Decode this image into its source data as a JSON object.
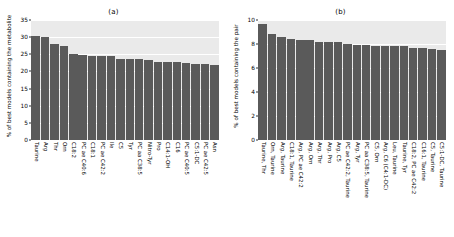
{
  "figure": {
    "panels": [
      {
        "title": "(a)",
        "ylabel": "% of best models containing the metabolite"
      },
      {
        "title": "(b)",
        "ylabel": "% of best models containing the pair"
      }
    ]
  },
  "chart_data": [
    {
      "type": "bar",
      "title": "(a)",
      "xlabel": "",
      "ylabel": "% of best models containing the metabolite",
      "ylim": [
        0,
        35
      ],
      "yticks": [
        0,
        5,
        10,
        15,
        20,
        25,
        30,
        35
      ],
      "grid": true,
      "legend": "none",
      "bar_color": "#5a5a5a",
      "categories": [
        "Taurine",
        "Arg",
        "Thr",
        "Orn",
        "C18:2",
        "PC ae C40:6",
        "C18:1",
        "PC ae C42:2",
        "Ile",
        "C5",
        "Tyr",
        "PC aa C38:5",
        "Nitro-Tyr",
        "Pro",
        "C14:1-OH",
        "C16",
        "PC ae C40:5",
        "C5:1-DC",
        "PC ae C42:5",
        "Asn"
      ],
      "values": [
        30.3,
        30.0,
        27.9,
        27.4,
        25.1,
        24.9,
        24.6,
        24.5,
        24.4,
        23.7,
        23.6,
        23.5,
        23.2,
        22.9,
        22.8,
        22.7,
        22.4,
        22.3,
        22.2,
        22.0
      ]
    },
    {
      "type": "bar",
      "title": "(b)",
      "xlabel": "",
      "ylabel": "% of best models containing the pair",
      "ylim": [
        0,
        10
      ],
      "yticks": [
        0,
        2,
        4,
        6,
        8,
        10
      ],
      "grid": true,
      "legend": "none",
      "bar_color": "#5a5a5a",
      "categories": [
        "Taurine, Thr",
        "Orn, Taurine",
        "Arg, Taurine",
        "C18:1, Taurine",
        "Arg, PC ae C42:2",
        "Arg, Orn",
        "Arg, Thr",
        "Arg, Pro",
        "Arg, C5",
        "PC ae C42:2, Taurine",
        "Arg, Tyr",
        "PC aa C38:5, Taurine",
        "C5, Orn",
        "Arg, C6 (C4:1-DC)",
        "Leu, Taurine",
        "Taurine, Tyr",
        "C18:2, PC ae C42:2",
        "C16:1, Taurine",
        "C5, Taurine",
        "C5:1-DC, Taurine"
      ],
      "values": [
        9.7,
        8.8,
        8.6,
        8.4,
        8.3,
        8.3,
        8.2,
        8.2,
        8.15,
        8.0,
        7.9,
        7.9,
        7.8,
        7.8,
        7.8,
        7.8,
        7.7,
        7.7,
        7.55,
        7.5
      ]
    }
  ]
}
